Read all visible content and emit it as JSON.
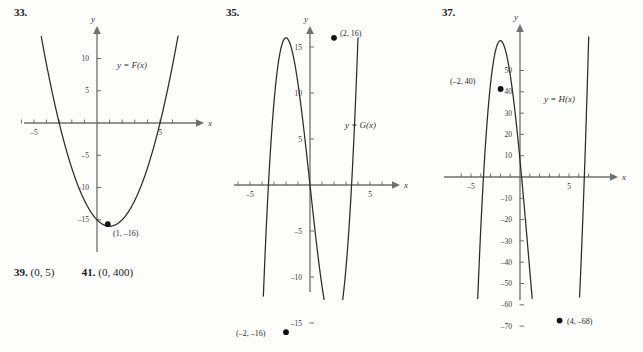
{
  "page": {
    "background": "#fdfdfb",
    "ink": "#2b2b2b",
    "axis_color": "#6f6f6f"
  },
  "answers_line": {
    "items": [
      {
        "number": "39.",
        "value": "(0, 5)"
      },
      {
        "number": "41.",
        "value": "(0, 400)"
      }
    ]
  },
  "panels": [
    {
      "number": "33.",
      "y_axis_label": "y",
      "x_axis_label": "x",
      "curve_label": "y = F(x)",
      "point_label": "(1, –16)",
      "x_ticks": [
        "–5",
        "5"
      ],
      "y_ticks": [
        "10",
        "5",
        "–5",
        "–10",
        "–15"
      ]
    },
    {
      "number": "35.",
      "y_axis_label": "y",
      "x_axis_label": "x",
      "curve_label": "y = G(x)",
      "point_label_max": "(2, 16)",
      "point_label_min": "(–2, –16)",
      "x_ticks": [
        "–5",
        "5"
      ],
      "y_ticks": [
        "15",
        "10",
        "5",
        "–5",
        "–10",
        "–15"
      ]
    },
    {
      "number": "37.",
      "y_axis_label": "y",
      "x_axis_label": "x",
      "curve_label": "y = H(x)",
      "point_label_max": "(–2, 40)",
      "point_label_min": "(4, –68)",
      "x_ticks": [
        "–5",
        "5"
      ],
      "y_ticks": [
        "50",
        "40",
        "30",
        "20",
        "10",
        "–10",
        "–20",
        "–30",
        "–40",
        "–50",
        "–60",
        "–70"
      ]
    }
  ],
  "chart_data": [
    {
      "type": "line",
      "id": "fig-33",
      "title": "33.",
      "function": "F(x) = x^2 - 2x - 15",
      "xlabel": "x",
      "ylabel": "y",
      "legend": [
        "y = F(x)"
      ],
      "xlim": [
        -6.2,
        6.6
      ],
      "ylim": [
        -18.5,
        12.5
      ],
      "xticks": [
        -6,
        -5,
        -4,
        -3,
        -2,
        -1,
        1,
        2,
        3,
        4,
        5,
        6
      ],
      "xtick_labels": {
        "-5": "–5",
        "5": "5"
      },
      "yticks": [
        10,
        5,
        -5,
        -10,
        -15
      ],
      "ytick_labels": [
        "10",
        "5",
        "–5",
        "–10",
        "–15"
      ],
      "annotations": [
        {
          "x": 1,
          "y": -16,
          "label": "(1, –16)",
          "marker": "dot"
        }
      ],
      "roots": [
        -3,
        5
      ],
      "y_intercept": -15,
      "grid": false
    },
    {
      "type": "line",
      "id": "fig-35",
      "title": "35.",
      "function": "G(x) = x^3 - 12x",
      "xlabel": "x",
      "ylabel": "y",
      "legend": [
        "y = G(x)"
      ],
      "xlim": [
        -6.4,
        6.6
      ],
      "ylim": [
        -19.5,
        19.0
      ],
      "xticks": [
        -6,
        -5,
        -4,
        -3,
        -2,
        -1,
        1,
        2,
        3,
        4,
        5,
        6
      ],
      "xtick_labels": {
        "-5": "–5",
        "5": "5"
      },
      "yticks": [
        15,
        10,
        5,
        -5,
        -10,
        -15
      ],
      "ytick_labels": [
        "15",
        "10",
        "5",
        "–5",
        "–10",
        "–15"
      ],
      "annotations": [
        {
          "x": 2,
          "y": 16,
          "label": "(2, 16)",
          "marker": "dot"
        },
        {
          "x": -2,
          "y": -16,
          "label": "(–2, –16)",
          "marker": "dot"
        }
      ],
      "roots": [
        -3.464,
        0,
        3.464
      ],
      "y_intercept": 0,
      "grid": false
    },
    {
      "type": "line",
      "id": "fig-37",
      "title": "37.",
      "function": "H(x) = 2x^3 - 6x^2 - 48x + 8",
      "xlabel": "x",
      "ylabel": "y",
      "legend": [
        "y = H(x)"
      ],
      "xlim": [
        -6.6,
        7.4
      ],
      "ylim": [
        -78,
        62
      ],
      "xticks": [
        -6,
        -5,
        -4,
        -3,
        -2,
        -1,
        1,
        2,
        3,
        4,
        5,
        6,
        7
      ],
      "xtick_labels": {
        "-5": "–5",
        "5": "5"
      },
      "yticks": [
        50,
        40,
        30,
        20,
        10,
        -10,
        -20,
        -30,
        -40,
        -50,
        -60,
        -70
      ],
      "ytick_labels": [
        "50",
        "40",
        "30",
        "20",
        "10",
        "–10",
        "–20",
        "–30",
        "–40",
        "–50",
        "–60",
        "–70"
      ],
      "annotations": [
        {
          "x": -2,
          "y": 40,
          "label": "(–2, 40)",
          "marker": "dot"
        },
        {
          "x": 4,
          "y": -68,
          "label": "(4, –68)",
          "marker": "dot"
        }
      ],
      "roots": [
        -4.17,
        0.166,
        6.0
      ],
      "y_intercept": 8,
      "grid": false
    }
  ]
}
